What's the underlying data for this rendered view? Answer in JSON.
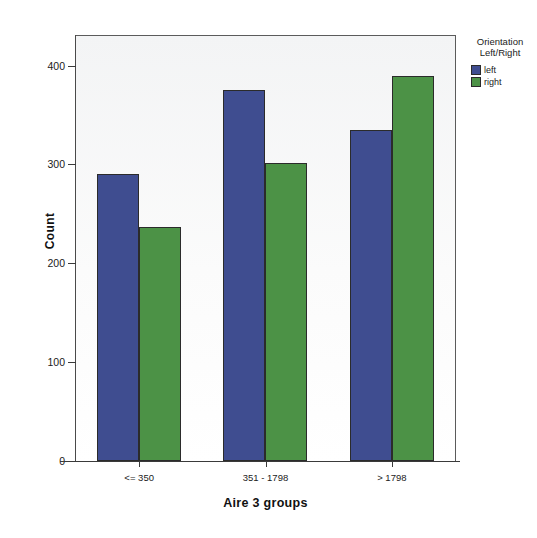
{
  "chart_data": {
    "type": "bar",
    "title": "",
    "subtitle": "",
    "xlabel": "Aire 3 groups",
    "ylabel": "Count",
    "categories": [
      "<= 350",
      "351 - 1798",
      "> 1798"
    ],
    "series": [
      {
        "name": "left",
        "color": "#3f4d90",
        "values": [
          290,
          375,
          335
        ]
      },
      {
        "name": "right",
        "color": "#4c9246",
        "values": [
          237,
          302,
          390
        ]
      }
    ],
    "ylim": [
      0,
      430
    ],
    "yticks": [
      0,
      100,
      200,
      300,
      400
    ],
    "ytick_labels": [
      "0",
      "100",
      "200",
      "300",
      "400"
    ],
    "grid": false,
    "legend": {
      "position": "right",
      "title_line1": "Orientation",
      "title_line2": "Left/Right",
      "entries": [
        "left",
        "right"
      ]
    },
    "colors": {
      "left": "#3f4d90",
      "right": "#4c9246",
      "plot_background": "#f6f7f8",
      "axis": "#3a3a3a",
      "bar_outline": "#2b2b2b"
    }
  }
}
